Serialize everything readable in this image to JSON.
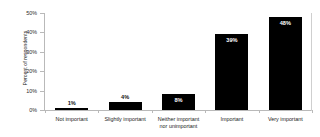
{
  "chart_data": {
    "type": "bar",
    "title": "",
    "xlabel": "",
    "ylabel": "Percent of respondents",
    "categories": [
      "Not important",
      "Slightly important",
      "Neither important nor unimportant",
      "Important",
      "Very important"
    ],
    "category_lines": [
      [
        "Not important"
      ],
      [
        "Slightly important"
      ],
      [
        "Neither important",
        "nor unimportant"
      ],
      [
        "Important"
      ],
      [
        "Very important"
      ]
    ],
    "values": [
      1,
      4,
      8,
      39,
      48
    ],
    "data_labels": [
      "1%",
      "4%",
      "8%",
      "39%",
      "48%"
    ],
    "ylim": [
      0,
      50
    ],
    "yticks": [
      0,
      10,
      20,
      30,
      40,
      50
    ],
    "ytick_labels": [
      "0%",
      "10%",
      "20%",
      "30%",
      "40%",
      "50%"
    ],
    "grid": false,
    "legend": null,
    "bar_color": "#000000",
    "axis_color": "#b9b9b9",
    "background_color": "#ffffff",
    "label_inside_color": "#ffffff",
    "label_outside_color": "#111111"
  }
}
